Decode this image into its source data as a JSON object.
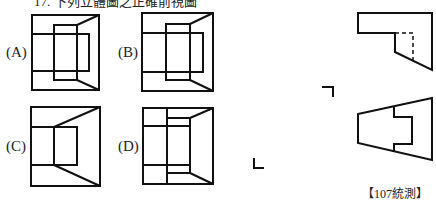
{
  "header": {
    "text": "17. 下列立體圖之正確前視圖"
  },
  "options": [
    {
      "id": "A",
      "label": "(A)"
    },
    {
      "id": "B",
      "label": "(B)"
    },
    {
      "id": "C",
      "label": "(C)"
    },
    {
      "id": "D",
      "label": "(D)"
    }
  ],
  "given_views": {
    "top_view": "top-view-drawing",
    "front_view": "front-view-drawing"
  },
  "caption": "【107統測】",
  "colors": {
    "line": "#111111",
    "background": "#ffffff"
  }
}
